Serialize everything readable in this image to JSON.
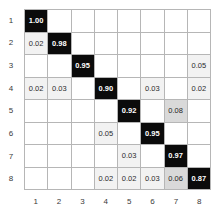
{
  "chart_data": {
    "type": "heatmap",
    "title": "",
    "subtitle": "",
    "xlabel": "",
    "ylabel": "",
    "grid": true,
    "legend": "none",
    "value_format": "0.00",
    "categories": [
      "1",
      "2",
      "3",
      "4",
      "5",
      "6",
      "7",
      "8"
    ],
    "row_labels": [
      "1",
      "2",
      "3",
      "4",
      "5",
      "6",
      "7",
      "8"
    ],
    "col_labels": [
      "1",
      "2",
      "3",
      "4",
      "5",
      "6",
      "7",
      "8"
    ],
    "colors": {
      "high_cell_bg": "#0b0b0b",
      "high_cell_text": "#ffffff",
      "mid_cell_bg": "#d9d9d9",
      "low_cell_bg": "#f2f2f2",
      "empty_cell_bg": "#ffffff",
      "grid_line": "#b6b6b6",
      "tick_text": "#3a3a3a"
    },
    "zlim": [
      0,
      1
    ],
    "cells": [
      [
        {
          "v": "1.00",
          "s": "high"
        },
        {
          "v": "",
          "s": "empty"
        },
        {
          "v": "",
          "s": "empty"
        },
        {
          "v": "",
          "s": "empty"
        },
        {
          "v": "",
          "s": "empty"
        },
        {
          "v": "",
          "s": "empty"
        },
        {
          "v": "",
          "s": "empty"
        },
        {
          "v": "",
          "s": "empty"
        }
      ],
      [
        {
          "v": "0.02",
          "s": "low"
        },
        {
          "v": "0.98",
          "s": "high"
        },
        {
          "v": "",
          "s": "empty"
        },
        {
          "v": "",
          "s": "empty"
        },
        {
          "v": "",
          "s": "empty"
        },
        {
          "v": "",
          "s": "empty"
        },
        {
          "v": "",
          "s": "empty"
        },
        {
          "v": "",
          "s": "empty"
        }
      ],
      [
        {
          "v": "",
          "s": "empty"
        },
        {
          "v": "",
          "s": "empty"
        },
        {
          "v": "0.95",
          "s": "high"
        },
        {
          "v": "",
          "s": "empty"
        },
        {
          "v": "",
          "s": "empty"
        },
        {
          "v": "",
          "s": "empty"
        },
        {
          "v": "",
          "s": "empty"
        },
        {
          "v": "0.05",
          "s": "low"
        }
      ],
      [
        {
          "v": "0.02",
          "s": "low"
        },
        {
          "v": "0.03",
          "s": "low"
        },
        {
          "v": "",
          "s": "empty"
        },
        {
          "v": "0.90",
          "s": "high"
        },
        {
          "v": "",
          "s": "empty"
        },
        {
          "v": "0.03",
          "s": "low"
        },
        {
          "v": "",
          "s": "empty"
        },
        {
          "v": "0.02",
          "s": "low"
        }
      ],
      [
        {
          "v": "",
          "s": "empty"
        },
        {
          "v": "",
          "s": "empty"
        },
        {
          "v": "",
          "s": "empty"
        },
        {
          "v": "",
          "s": "empty"
        },
        {
          "v": "0.92",
          "s": "high"
        },
        {
          "v": "",
          "s": "empty"
        },
        {
          "v": "0.08",
          "s": "mid"
        },
        {
          "v": "",
          "s": "empty"
        }
      ],
      [
        {
          "v": "",
          "s": "empty"
        },
        {
          "v": "",
          "s": "empty"
        },
        {
          "v": "",
          "s": "empty"
        },
        {
          "v": "0.05",
          "s": "low"
        },
        {
          "v": "",
          "s": "empty"
        },
        {
          "v": "0.95",
          "s": "high"
        },
        {
          "v": "",
          "s": "empty"
        },
        {
          "v": "",
          "s": "empty"
        }
      ],
      [
        {
          "v": "",
          "s": "empty"
        },
        {
          "v": "",
          "s": "empty"
        },
        {
          "v": "",
          "s": "empty"
        },
        {
          "v": "",
          "s": "empty"
        },
        {
          "v": "0.03",
          "s": "low"
        },
        {
          "v": "",
          "s": "empty"
        },
        {
          "v": "0.97",
          "s": "high"
        },
        {
          "v": "",
          "s": "empty"
        }
      ],
      [
        {
          "v": "",
          "s": "empty"
        },
        {
          "v": "",
          "s": "empty"
        },
        {
          "v": "",
          "s": "empty"
        },
        {
          "v": "0.02",
          "s": "low"
        },
        {
          "v": "0.02",
          "s": "low"
        },
        {
          "v": "0.03",
          "s": "low"
        },
        {
          "v": "0.06",
          "s": "mid"
        },
        {
          "v": "0.87",
          "s": "high"
        }
      ]
    ]
  }
}
